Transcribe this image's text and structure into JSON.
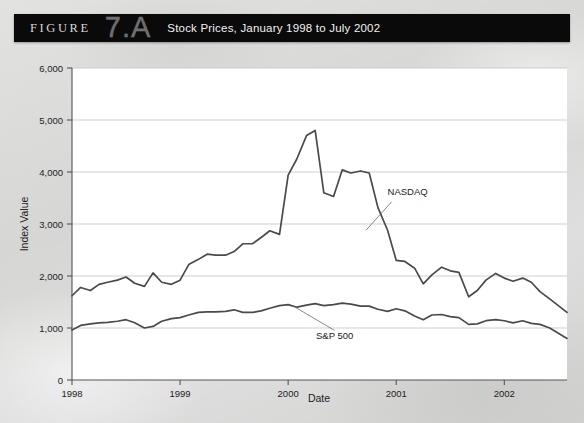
{
  "header": {
    "figure_word": "FIGURE",
    "figure_number": "7.A",
    "title": "Stock Prices, January 1998 to July 2002"
  },
  "chart_data": {
    "type": "line",
    "title": "Stock Prices, January 1998 to July 2002",
    "xlabel": "Date",
    "ylabel": "Index Value",
    "xlim": [
      1998.0,
      2002.58
    ],
    "ylim": [
      0,
      6000
    ],
    "ytick_labels": [
      "0",
      "1,000",
      "2,000",
      "3,000",
      "4,000",
      "5,000",
      "6,000"
    ],
    "ytick_values": [
      0,
      1000,
      2000,
      3000,
      4000,
      5000,
      6000
    ],
    "xtick_labels": [
      "1998",
      "1999",
      "2000",
      "2001",
      "2002"
    ],
    "xtick_values": [
      1998,
      1999,
      2000,
      2001,
      2002
    ],
    "grid": "horizontal",
    "legend_position": "inline-annotations",
    "series": [
      {
        "name": "NASDAQ",
        "label_x": 2000.92,
        "label_y": 3560,
        "leader_to_x": 2000.72,
        "leader_to_y": 2880,
        "x": [
          1998.0,
          1998.08,
          1998.17,
          1998.25,
          1998.33,
          1998.42,
          1998.5,
          1998.58,
          1998.67,
          1998.75,
          1998.83,
          1998.92,
          1999.0,
          1999.08,
          1999.17,
          1999.25,
          1999.33,
          1999.42,
          1999.5,
          1999.58,
          1999.67,
          1999.75,
          1999.83,
          1999.92,
          2000.0,
          2000.08,
          2000.17,
          2000.25,
          2000.33,
          2000.42,
          2000.5,
          2000.58,
          2000.67,
          2000.75,
          2000.83,
          2000.92,
          2001.0,
          2001.08,
          2001.17,
          2001.25,
          2001.33,
          2001.42,
          2001.5,
          2001.58,
          2001.67,
          2001.75,
          2001.83,
          2001.92,
          2002.0,
          2002.08,
          2002.17,
          2002.25,
          2002.33,
          2002.42,
          2002.5,
          2002.58
        ],
        "y": [
          1620,
          1780,
          1720,
          1840,
          1880,
          1920,
          1980,
          1860,
          1800,
          2060,
          1880,
          1840,
          1920,
          2220,
          2320,
          2420,
          2400,
          2400,
          2470,
          2620,
          2620,
          2740,
          2870,
          2800,
          3940,
          4250,
          4700,
          4800,
          3600,
          3530,
          4040,
          3980,
          4020,
          3980,
          3320,
          2880,
          2300,
          2280,
          2150,
          1850,
          2020,
          2170,
          2100,
          2070,
          1600,
          1720,
          1920,
          2050,
          1960,
          1900,
          1960,
          1880,
          1700,
          1560,
          1430,
          1300
        ]
      },
      {
        "name": "S&P 500",
        "label_x": 2000.43,
        "label_y": 780,
        "leader_to_x": 2000.04,
        "leader_to_y": 1430,
        "x": [
          1998.0,
          1998.08,
          1998.17,
          1998.25,
          1998.33,
          1998.42,
          1998.5,
          1998.58,
          1998.67,
          1998.75,
          1998.83,
          1998.92,
          1999.0,
          1999.08,
          1999.17,
          1999.25,
          1999.33,
          1999.42,
          1999.5,
          1999.58,
          1999.67,
          1999.75,
          1999.83,
          1999.92,
          2000.0,
          2000.08,
          2000.17,
          2000.25,
          2000.33,
          2000.42,
          2000.5,
          2000.58,
          2000.67,
          2000.75,
          2000.83,
          2000.92,
          2001.0,
          2001.08,
          2001.17,
          2001.25,
          2001.33,
          2001.42,
          2001.5,
          2001.58,
          2001.67,
          2001.75,
          2001.83,
          2001.92,
          2002.0,
          2002.08,
          2002.17,
          2002.25,
          2002.33,
          2002.42,
          2002.5,
          2002.58
        ],
        "y": [
          960,
          1050,
          1080,
          1100,
          1110,
          1130,
          1160,
          1100,
          1000,
          1030,
          1130,
          1180,
          1200,
          1250,
          1300,
          1310,
          1310,
          1320,
          1350,
          1300,
          1300,
          1330,
          1380,
          1430,
          1450,
          1400,
          1440,
          1470,
          1430,
          1450,
          1480,
          1460,
          1420,
          1420,
          1360,
          1320,
          1370,
          1330,
          1230,
          1160,
          1250,
          1260,
          1220,
          1200,
          1070,
          1080,
          1140,
          1160,
          1140,
          1100,
          1140,
          1090,
          1070,
          1000,
          900,
          800
        ]
      }
    ]
  }
}
